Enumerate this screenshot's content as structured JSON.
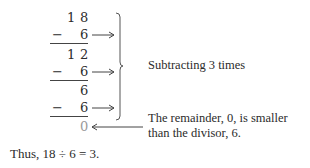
{
  "division": {
    "rows": [
      {
        "op": "",
        "tens": "1",
        "ones": "8"
      },
      {
        "op": "−",
        "tens": "",
        "ones": "6",
        "arrow": true
      },
      {
        "op": "",
        "tens": "1",
        "ones": "2"
      },
      {
        "op": "−",
        "tens": "",
        "ones": "6",
        "arrow": true
      },
      {
        "op": "",
        "tens": "",
        "ones": "6"
      },
      {
        "op": "−",
        "tens": "",
        "ones": "6",
        "arrow": true
      },
      {
        "op": "",
        "tens": "",
        "ones": "0",
        "remainder": true
      }
    ]
  },
  "annotations": {
    "brace_label": "Subtracting 3 times",
    "remainder_line1": "The remainder, 0, is smaller",
    "remainder_line2": "than the divisor, 6."
  },
  "conclusion": "Thus, 18 ÷ 6 = 3.",
  "colors": {
    "text": "#2b2b2b",
    "remainder": "#9a9a9a",
    "lines": "#444444"
  }
}
